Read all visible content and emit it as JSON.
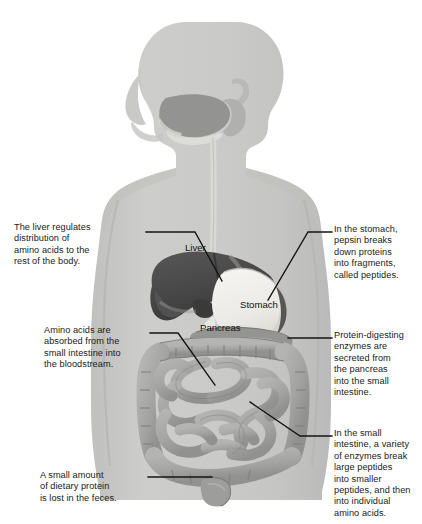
{
  "figure": {
    "colors": {
      "background": "#ffffff",
      "body_silhouette": "#c9c9c7",
      "body_shadow": "#bcbcba",
      "liver": "#4c4c4c",
      "liver_dark": "#3a3a3a",
      "stomach": "#f2f1ee",
      "stomach_shade": "#d9d8d4",
      "pancreas": "#8f8f8d",
      "intestine": "#a8a8a6",
      "intestine_dark": "#8a8a88",
      "outline": "#4a4a4a",
      "leader_line": "#141414",
      "text": "#1a1a1a"
    }
  },
  "organ_labels": [
    {
      "id": "liver",
      "text": "Liver"
    },
    {
      "id": "stomach",
      "text": "Stomach"
    },
    {
      "id": "pancreas",
      "text": "Pancreas"
    }
  ],
  "callouts": [
    {
      "id": "liver-note",
      "side": "left",
      "text": "The liver regulates\ndistribution of\namino acids to the\nrest of the body."
    },
    {
      "id": "absorb-note",
      "side": "left",
      "text": "Amino acids are\nabsorbed from the\nsmall intestine into\nthe bloodstream."
    },
    {
      "id": "feces-note",
      "side": "left",
      "text": "A small amount\nof dietary protein\nis lost in the feces."
    },
    {
      "id": "stomach-note",
      "side": "right",
      "text": "In the stomach,\npepsin breaks\ndown proteins\ninto fragments,\ncalled peptides."
    },
    {
      "id": "pancreas-note",
      "side": "right",
      "text": "Protein-digesting\nenzymes are\nsecreted from\nthe pancreas\ninto the small\nintestine."
    },
    {
      "id": "intestine-note",
      "side": "right",
      "text": "In the small\nintestine, a variety\nof enzymes break\nlarge peptides\ninto smaller\npeptides, and then\ninto individual\namino acids."
    }
  ]
}
